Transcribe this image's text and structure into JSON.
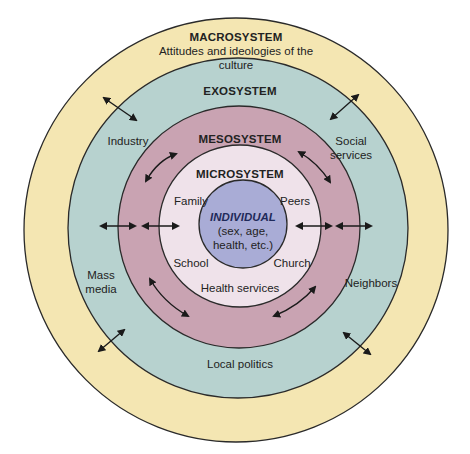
{
  "diagram": {
    "colors": {
      "macrosystem": "#f4e6b2",
      "exosystem": "#b7d2cf",
      "mesosystem": "#c9a3b2",
      "microsystem": "#efe2ea",
      "individual": "#a9acd6",
      "stroke": "#2a2a2a",
      "text": "#222222"
    },
    "layers": {
      "macrosystem": {
        "title": "MACROSYSTEM",
        "subtitle_line1": "Attitudes and ideologies of the",
        "subtitle_line2": "culture"
      },
      "exosystem": {
        "title": "EXOSYSTEM",
        "items": [
          "Industry",
          "Social services",
          "Mass media",
          "Neighbors",
          "Local politics"
        ],
        "item_industry": "Industry",
        "item_social_1": "Social",
        "item_social_2": "services",
        "item_mass_1": "Mass",
        "item_mass_2": "media",
        "item_neighbors": "Neighbors",
        "item_local_politics": "Local politics"
      },
      "mesosystem": {
        "title": "MESOSYSTEM"
      },
      "microsystem": {
        "title": "MICROSYSTEM",
        "items": [
          "Family",
          "Peers",
          "School",
          "Church",
          "Health services"
        ],
        "item_family": "Family",
        "item_peers": "Peers",
        "item_school": "School",
        "item_church": "Church",
        "item_health": "Health services"
      },
      "individual": {
        "title": "INDIVIDUAL",
        "line1": "(sex, age,",
        "line2": "health, etc.)"
      }
    }
  }
}
